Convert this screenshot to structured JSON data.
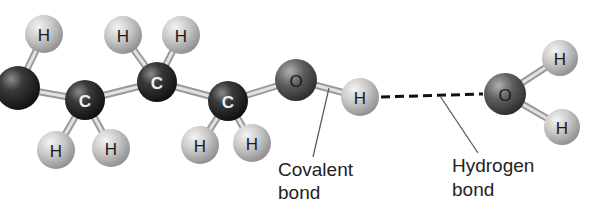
{
  "diagram": {
    "type": "molecular-ball-and-stick",
    "colors": {
      "carbon": "#2a2a2a",
      "oxygen": "#5a5a5a",
      "hydrogen": "#c4c4c4",
      "bond_stick": "#bdbdbd",
      "label_dark": "#1a1a1a",
      "label_light": "#f0f0f0",
      "callout_text": "#222222",
      "callout_line": "#555555",
      "hydrogen_bond_dash": "#111111"
    },
    "atoms": [
      {
        "id": "c0",
        "element": "C",
        "label": "",
        "x": 18,
        "y": 88,
        "r": 22
      },
      {
        "id": "h0",
        "element": "H",
        "label": "H",
        "x": 44,
        "y": 34,
        "r": 19
      },
      {
        "id": "c1",
        "element": "C",
        "label": "C",
        "x": 85,
        "y": 100,
        "r": 20
      },
      {
        "id": "h1",
        "element": "H",
        "label": "H",
        "x": 56,
        "y": 150,
        "r": 19
      },
      {
        "id": "h2",
        "element": "H",
        "label": "H",
        "x": 111,
        "y": 148,
        "r": 19
      },
      {
        "id": "h3",
        "element": "H",
        "label": "H",
        "x": 123,
        "y": 35,
        "r": 19
      },
      {
        "id": "c2",
        "element": "C",
        "label": "C",
        "x": 157,
        "y": 82,
        "r": 20
      },
      {
        "id": "h4",
        "element": "H",
        "label": "H",
        "x": 181,
        "y": 35,
        "r": 19
      },
      {
        "id": "c3",
        "element": "C",
        "label": "C",
        "x": 228,
        "y": 101,
        "r": 20
      },
      {
        "id": "h5",
        "element": "H",
        "label": "H",
        "x": 200,
        "y": 145,
        "r": 19
      },
      {
        "id": "h6",
        "element": "H",
        "label": "H",
        "x": 252,
        "y": 143,
        "r": 19
      },
      {
        "id": "o1",
        "element": "O",
        "label": "O",
        "x": 296,
        "y": 80,
        "r": 21
      },
      {
        "id": "h7",
        "element": "H",
        "label": "H",
        "x": 360,
        "y": 97,
        "r": 19
      },
      {
        "id": "o2",
        "element": "O",
        "label": "O",
        "x": 505,
        "y": 94,
        "r": 21
      },
      {
        "id": "h8",
        "element": "H",
        "label": "H",
        "x": 560,
        "y": 58,
        "r": 18
      },
      {
        "id": "h9",
        "element": "H",
        "label": "H",
        "x": 562,
        "y": 127,
        "r": 18
      }
    ],
    "bonds": [
      {
        "from": "c0",
        "to": "h0"
      },
      {
        "from": "c0",
        "to": "c1"
      },
      {
        "from": "c1",
        "to": "h1"
      },
      {
        "from": "c1",
        "to": "h2"
      },
      {
        "from": "c1",
        "to": "c2"
      },
      {
        "from": "c2",
        "to": "h3"
      },
      {
        "from": "c2",
        "to": "h4"
      },
      {
        "from": "c2",
        "to": "c3"
      },
      {
        "from": "c3",
        "to": "h5"
      },
      {
        "from": "c3",
        "to": "h6"
      },
      {
        "from": "c3",
        "to": "o1"
      },
      {
        "from": "o1",
        "to": "h7"
      },
      {
        "from": "o2",
        "to": "h8"
      },
      {
        "from": "o2",
        "to": "h9"
      }
    ],
    "hydrogen_bond": {
      "from": "h7",
      "to": "o2",
      "style": "dashed"
    },
    "callouts": [
      {
        "id": "covalent",
        "lines": [
          "Covalent",
          "bond"
        ],
        "pointer": {
          "x1": 329,
          "y1": 88,
          "x2": 313,
          "y2": 157
        },
        "text_x": 278,
        "text_y": [
          176,
          199
        ]
      },
      {
        "id": "hydrogen",
        "lines": [
          "Hydrogen",
          "bond"
        ],
        "pointer": {
          "x1": 440,
          "y1": 96,
          "x2": 478,
          "y2": 153
        },
        "text_x": 452,
        "text_y": [
          172,
          196
        ]
      }
    ]
  }
}
